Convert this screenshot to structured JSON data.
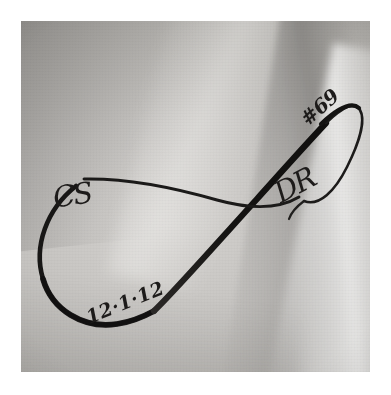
{
  "image": {
    "kind": "photograph",
    "subject": "infinity-symbol-tattoo-on-skin",
    "palette": "grayscale",
    "frame_color": "#ffffff",
    "skin_base_color": "#c6c4c1",
    "ink_color": "#1d1b1a",
    "width": 391,
    "height": 395,
    "photo": {
      "left": 21,
      "top": 21,
      "width": 349,
      "height": 351
    }
  },
  "tattoo": {
    "motif": "infinity-loop",
    "labels": {
      "initials_left": "CS",
      "initials_right": "DR",
      "number": "#69",
      "date": "12·1·12"
    },
    "strokes": [
      {
        "name": "left-loop",
        "weight": "thick"
      },
      {
        "name": "diagonal-bold-stroke",
        "weight": "thick"
      },
      {
        "name": "horizontal-thin-stroke",
        "weight": "thin"
      },
      {
        "name": "right-loop",
        "weight": "thin"
      }
    ]
  }
}
